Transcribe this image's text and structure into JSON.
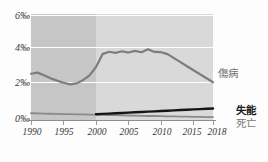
{
  "chart_data": {
    "type": "line",
    "title": "",
    "xlabel": "",
    "ylabel": "",
    "xlim": [
      1990,
      2018
    ],
    "ylim": [
      0,
      6.6
    ],
    "grid": true,
    "legend_position": "right",
    "y_tick_labels": [
      "6‰",
      "4‰",
      "2‰",
      "0‰"
    ],
    "y_tick_values": [
      6,
      4,
      2,
      0
    ],
    "x_tick_labels": [
      "1990",
      "1995",
      "2000",
      "2005",
      "2010",
      "2015",
      "2018"
    ],
    "x_tick_values": [
      1990,
      1995,
      2000,
      2005,
      2010,
      2015,
      2018
    ],
    "shaded_region": {
      "from": 1990,
      "to": 2000
    },
    "series": [
      {
        "name": "傷病",
        "color": "#7d7d7d",
        "x": [
          1990,
          1991,
          1992,
          1993,
          1994,
          1995,
          1996,
          1997,
          1998,
          1999,
          2000,
          2001,
          2002,
          2003,
          2004,
          2005,
          2006,
          2007,
          2008,
          2009,
          2010,
          2011,
          2012,
          2013,
          2014,
          2015,
          2016,
          2017,
          2018
        ],
        "values": [
          2.88,
          2.95,
          2.78,
          2.6,
          2.45,
          2.32,
          2.22,
          2.28,
          2.48,
          2.78,
          3.3,
          4.1,
          4.25,
          4.18,
          4.28,
          4.2,
          4.3,
          4.22,
          4.4,
          4.24,
          4.22,
          4.1,
          3.85,
          3.6,
          3.35,
          3.1,
          2.85,
          2.6,
          2.35
        ]
      },
      {
        "name": "失能",
        "color": "#141414",
        "x": [
          2000,
          2001,
          2002,
          2003,
          2004,
          2005,
          2006,
          2007,
          2008,
          2009,
          2010,
          2011,
          2012,
          2013,
          2014,
          2015,
          2016,
          2017,
          2018
        ],
        "values": [
          0.36,
          0.38,
          0.4,
          0.42,
          0.44,
          0.46,
          0.48,
          0.5,
          0.52,
          0.54,
          0.56,
          0.58,
          0.6,
          0.62,
          0.64,
          0.66,
          0.68,
          0.7,
          0.72
        ]
      },
      {
        "name": "死亡",
        "color": "#8a8a8a",
        "x": [
          1990,
          1991,
          1992,
          1993,
          1994,
          1995,
          1996,
          1997,
          1998,
          1999,
          2000,
          2001,
          2002,
          2003,
          2004,
          2005,
          2006,
          2007,
          2008,
          2009,
          2010,
          2011,
          2012,
          2013,
          2014,
          2015,
          2016,
          2017,
          2018
        ],
        "values": [
          0.42,
          0.41,
          0.4,
          0.39,
          0.38,
          0.37,
          0.36,
          0.35,
          0.35,
          0.34,
          0.33,
          0.32,
          0.31,
          0.3,
          0.29,
          0.28,
          0.27,
          0.26,
          0.25,
          0.25,
          0.24,
          0.23,
          0.22,
          0.21,
          0.21,
          0.2,
          0.19,
          0.18,
          0.18
        ]
      }
    ]
  },
  "legend": {
    "shoubyou": "傷病",
    "shitsunou": "失能",
    "shibou": "死亡"
  }
}
